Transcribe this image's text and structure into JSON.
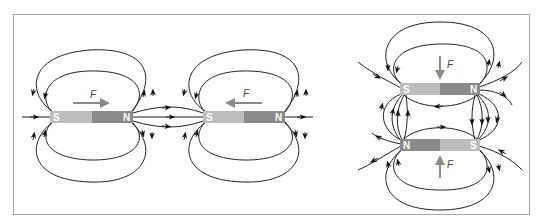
{
  "figure": {
    "colors": {
      "frame": "#a6a6a6",
      "south_pole": "#bdbdbd",
      "north_pole": "#8a8a8a",
      "force_arrow": "#8c8c8c",
      "field_line": "#222222"
    },
    "panels": [
      {
        "id": "horizontal-pair",
        "magnets": [
          {
            "left_pole": "S",
            "right_pole": "N",
            "force_label": "F",
            "force_direction": "right"
          },
          {
            "left_pole": "S",
            "right_pole": "N",
            "force_label": "F",
            "force_direction": "left"
          }
        ]
      },
      {
        "id": "stacked-pair",
        "magnets": [
          {
            "left_pole": "S",
            "right_pole": "N",
            "force_label": "F",
            "force_direction": "down"
          },
          {
            "left_pole": "N",
            "right_pole": "S",
            "force_label": "F",
            "force_direction": "up"
          }
        ]
      }
    ]
  }
}
